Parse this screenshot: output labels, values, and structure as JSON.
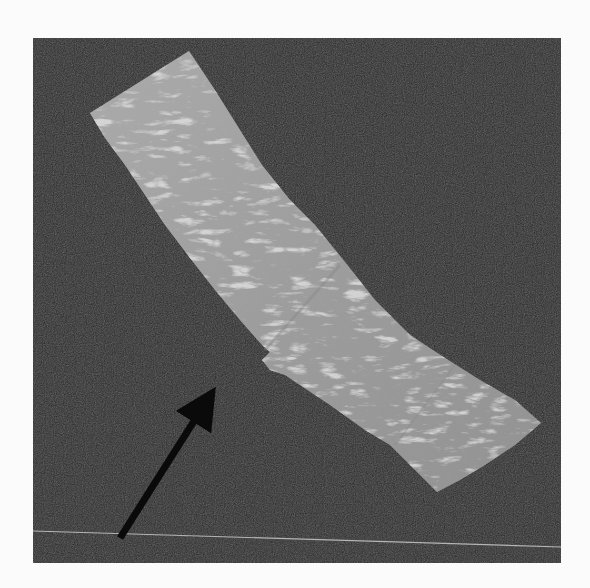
{
  "image": {
    "description": "Grayscale rendering of a textured elongated strip (surface with bright specular speckles) lying diagonally on a dark background, with a black arrow pointing to a notch on the lower-left edge of the strip.",
    "colors": {
      "page_background": "#fbfbfb",
      "panel_background": "#2a2a2a",
      "strip_base": "#9a9a9a",
      "strip_highlight": "#e6e6e6",
      "strip_shadow": "#7a7a7a",
      "arrow": "#0a0a0a",
      "baseline": "#b5b5b5"
    },
    "panel": {
      "x": 33,
      "y": 38,
      "width": 528,
      "height": 525
    },
    "strip_polygon": "90,113 189,51 215,90 240,130 262,165 290,200 315,225 345,262 375,300 410,335 445,358 480,380 515,400 541,423 515,445 485,465 460,480 437,492 415,470 390,445 365,430 330,405 300,385 285,375 270,370 262,360 270,352 262,345 240,320 215,290 190,258 165,225 145,195 125,165 105,138",
    "arrow": {
      "x1": 120,
      "y1": 538,
      "x2": 215,
      "y2": 388
    },
    "baseline": {
      "x1": 33,
      "y1": 531,
      "x2": 561,
      "y2": 547
    }
  }
}
